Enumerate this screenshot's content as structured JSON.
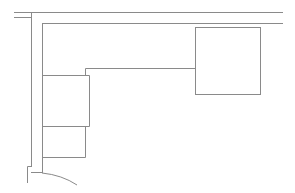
{
  "diagram": {
    "type": "floor-plan-line-drawing",
    "stroke_color": "#8a8a8a",
    "background": "#ffffff",
    "elements": {
      "outer_wall_top": {
        "y": 12,
        "x1": 31,
        "x2": 283
      },
      "outer_wall_left": {
        "x": 31,
        "y1": 12,
        "y2": 167
      },
      "wall_stub": {
        "y": 17,
        "x1": 26,
        "x2": 31
      },
      "inner_counter_top": {
        "y": 23,
        "x1": 42,
        "x2": 283
      },
      "inner_counter_left": {
        "x": 42,
        "y1": 23,
        "y2": 173
      },
      "counter_edge": {
        "y": 68,
        "x1": 85,
        "x2": 195
      },
      "appliance_box": {
        "x": 195,
        "y": 27,
        "w": 66,
        "h": 68
      },
      "cabinet_upper": {
        "x": 42,
        "y": 75,
        "w": 47,
        "h": 51
      },
      "cabinet_lower": {
        "x": 42,
        "y": 126,
        "w": 43,
        "h": 31
      },
      "door_swing": {
        "start": [
          42,
          173
        ],
        "end": [
          76,
          185
        ]
      }
    }
  }
}
